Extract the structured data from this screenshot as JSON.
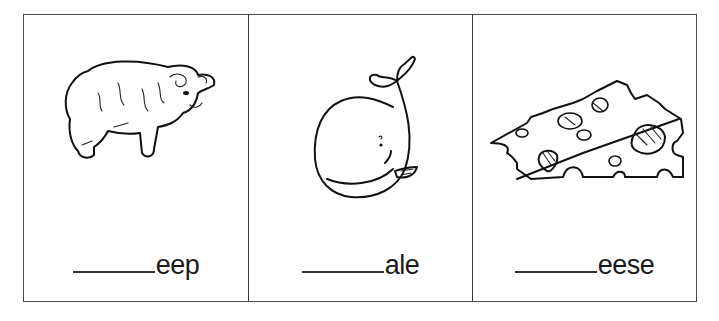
{
  "worksheet": {
    "cards": [
      {
        "picture": "sheep",
        "blank": "________",
        "suffix": "eep"
      },
      {
        "picture": "whale",
        "blank": "________",
        "suffix": "ale"
      },
      {
        "picture": "cheese",
        "blank": "________",
        "suffix": "eese"
      }
    ]
  }
}
